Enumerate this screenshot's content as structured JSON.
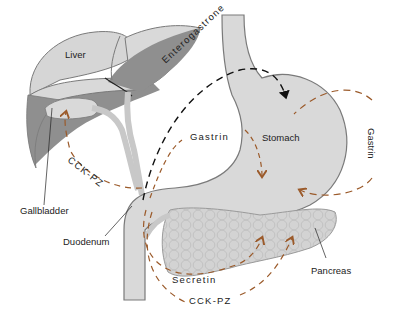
{
  "diagram": {
    "colors": {
      "organ_light": "#d6d6d6",
      "organ_dark": "#8f8f8f",
      "organ_outline": "#7a7a7a",
      "hormone_orange": "#9b5a2a",
      "hormone_black": "#111111",
      "text": "#222222"
    },
    "organs": [
      {
        "id": "liver",
        "label": "Liver"
      },
      {
        "id": "stomach",
        "label": "Stomach"
      },
      {
        "id": "gallbladder",
        "label": "Gallbladder"
      },
      {
        "id": "duodenum",
        "label": "Duodenum"
      },
      {
        "id": "pancreas",
        "label": "Pancreas"
      }
    ],
    "hormones": [
      {
        "id": "enterogastrone",
        "label": "Enterogastrone",
        "from": "Duodenum",
        "to": "Stomach",
        "line": "black dashed"
      },
      {
        "id": "gastrin_inner",
        "label": "Gastrin",
        "from": "Duodenum",
        "to": "Stomach",
        "line": "orange dashed"
      },
      {
        "id": "gastrin_outer",
        "label": "Gastrin",
        "from": "Stomach",
        "to": "Stomach",
        "line": "orange dashed"
      },
      {
        "id": "cck_pz_gallbladder",
        "label": "CCK-PZ",
        "from": "Duodenum",
        "to": "Gallbladder",
        "line": "orange dashed"
      },
      {
        "id": "secretin",
        "label": "Secretin",
        "from": "Duodenum",
        "to": "Pancreas",
        "line": "orange dashed"
      },
      {
        "id": "cck_pz_pancreas",
        "label": "CCK-PZ",
        "from": "Duodenum",
        "to": "Pancreas",
        "line": "orange dashed"
      }
    ]
  }
}
